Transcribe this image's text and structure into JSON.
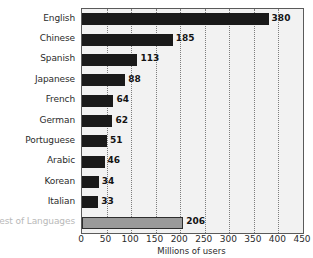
{
  "chart_data": {
    "type": "bar",
    "orientation": "horizontal",
    "title": "",
    "xlabel": "Millions of users",
    "ylabel": "",
    "xlim": [
      0,
      450
    ],
    "xticks": [
      0,
      50,
      100,
      150,
      200,
      250,
      300,
      350,
      400,
      450
    ],
    "grid": true,
    "legend": "none",
    "categories": [
      "English",
      "Chinese",
      "Spanish",
      "Japanese",
      "French",
      "German",
      "Portuguese",
      "Arabic",
      "Korean",
      "Italian",
      "Rest of Languages"
    ],
    "values": [
      380,
      185,
      113,
      88,
      64,
      62,
      51,
      46,
      34,
      33,
      206
    ],
    "value_labels": [
      "380",
      "185",
      "113",
      "88",
      "64",
      "62",
      "51",
      "46",
      "34",
      "33",
      "206"
    ],
    "series": [
      {
        "name": "Millions of users",
        "values": [
          380,
          185,
          113,
          88,
          64,
          62,
          51,
          46,
          34,
          33,
          206
        ]
      }
    ],
    "colors": {
      "bar": "#1a1a1a",
      "bar_rest": "#9a9a9a",
      "bar_rest_border": "#2e2e2e",
      "plot_background": "#f2f2f2",
      "plot_border": "#5a5a5a",
      "gridline": "#7d7d7d",
      "text": "#2b2b2b",
      "muted_text": "#b9b9b9"
    },
    "muted_categories": [
      "Rest of Languages"
    ]
  }
}
